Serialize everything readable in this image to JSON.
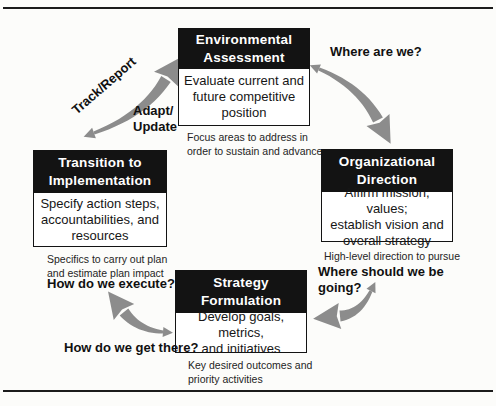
{
  "figure": {
    "background": "#fcfcfa",
    "box_black": "#131313",
    "arrow_color": "#8c8c8c",
    "rule_color": "#1c1c1c"
  },
  "boxes": {
    "environmental": {
      "title": "Environmental\nAssessment",
      "body": "Evaluate current and\nfuture competitive\nposition",
      "caption": "Focus areas to address in\norder to sustain and advance"
    },
    "organizational": {
      "title": "Organizational\nDirection",
      "body": "Affirm mission, values;\nestablish vision and\noverall strategy",
      "caption": "High-level direction to pursue"
    },
    "strategy": {
      "title": "Strategy\nFormulation",
      "body": "Develop goals, metrics,\nand initiatives",
      "caption": "Key desired outcomes and\npriority activities"
    },
    "transition": {
      "title": "Transition to\nImplementation",
      "body": "Specify action steps,\naccountabilities, and\nresources",
      "caption": "Specifics to carry out plan\nand estimate plan impact"
    }
  },
  "labels": {
    "where_are_we": "Where are we?",
    "where_should_we_be_going": "Where should we be\ngoing?",
    "how_do_we_get_there": "How do we get there?",
    "how_do_we_execute": "How do we execute?",
    "track_report": "Track/Report",
    "adapt_update": "Adapt/\nUpdate"
  }
}
